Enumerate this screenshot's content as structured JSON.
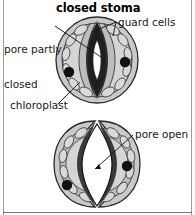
{
  "figure": {
    "kind": "biology-diagram",
    "subject": "stoma",
    "background_color": "#ffffff",
    "frame_color": "#4a4a4a"
  },
  "palette": {
    "outline": "#2b2b2b",
    "epidermis_fill": "#c9c9c9",
    "guard_cell_fill": "#b4b4b4",
    "guard_cell_inner_fill": "#d5d5d5",
    "chloroplast_fill": "#d9d9d9",
    "nucleus_fill": "#111111",
    "pore_dark": "#2f2f2f",
    "pore_open_fill": "#ffffff",
    "leader_line": "#111111",
    "text": "#1a1a1a"
  },
  "panels": [
    {
      "id": "closed",
      "title": "closed stoma",
      "state": "closed",
      "pore_description": "pore partly closed, narrow dark slit",
      "nuclei_count": 2,
      "labels": [
        {
          "id": "pore-partly-closed",
          "text": "pore partly\nclosed",
          "line1": "pore partly",
          "line2": "closed"
        },
        {
          "id": "guard-cells",
          "text": "guard cells"
        },
        {
          "id": "chloroplast",
          "text": "chloroplast"
        }
      ]
    },
    {
      "id": "open",
      "title": "open stoma",
      "state": "open",
      "pore_description": "pore open, wide white lens-shaped aperture",
      "nuclei_count": 2,
      "labels": [
        {
          "id": "pore-open",
          "text": "pore open"
        }
      ]
    }
  ],
  "labels": {
    "closed_title": "closed stoma",
    "open_title": "open stoma",
    "pore_partly_closed_line1": "pore partly",
    "pore_partly_closed_line2": "closed",
    "guard_cells": "guard cells",
    "chloroplast": "chloroplast",
    "pore_open": "pore open"
  }
}
